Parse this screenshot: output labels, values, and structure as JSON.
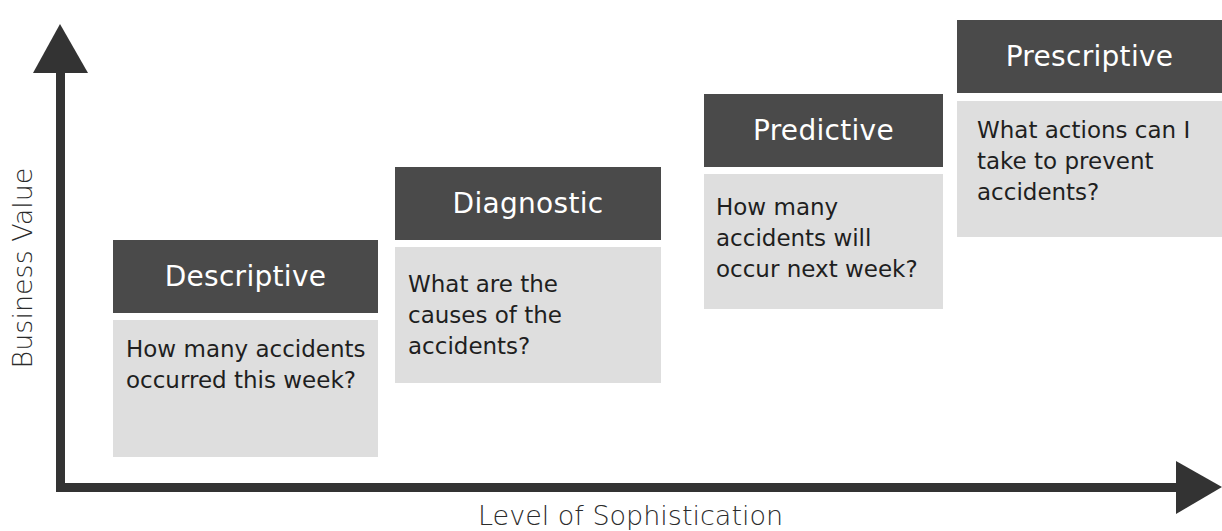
{
  "diagram": {
    "y_axis_label": "Business Value",
    "x_axis_label": "Level of Sophistication",
    "colors": {
      "axis": "#333333",
      "header_bg": "#4a4a4a",
      "header_text": "#ffffff",
      "body_bg": "#dedede",
      "body_text": "#1f1f1f"
    },
    "stages": [
      {
        "title": "Descriptive",
        "question": "How many accidents occurred this week?"
      },
      {
        "title": "Diagnostic",
        "question": "What are the causes of the accidents?"
      },
      {
        "title": "Predictive",
        "question": "How many accidents will occur next week?"
      },
      {
        "title": "Prescriptive",
        "question": "What actions can I take to prevent accidents?"
      }
    ]
  }
}
